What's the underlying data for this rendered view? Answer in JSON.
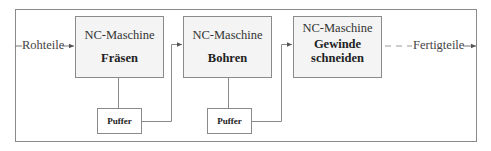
{
  "diagram": {
    "input_label": "Rohteile",
    "output_label": "Fertigteile",
    "machines": [
      {
        "title": "NC-Maschine",
        "operation": "Fräsen"
      },
      {
        "title": "NC-Maschine",
        "operation": "Bohren"
      },
      {
        "title": "NC-Maschine",
        "operation_line1": "Gewinde",
        "operation_line2": "schneiden"
      }
    ],
    "buffers": [
      {
        "label": "Puffer"
      },
      {
        "label": "Puffer"
      }
    ],
    "colors": {
      "line": "#8a8a8a",
      "box_fill": "#f4f4f4",
      "text": "#222222"
    }
  }
}
